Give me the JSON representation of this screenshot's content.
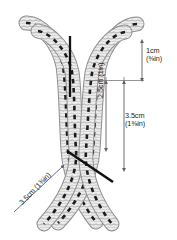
{
  "figure": {
    "type": "braided-cord-knot-diagram"
  },
  "colors": {
    "cord_fill": "#e8e8e8",
    "cord_outline": "#9a9a9a",
    "cord_dash": "#1a1a1a",
    "guide_line": "#6e6e6e",
    "pointer": "#111111",
    "text": "#231f20",
    "background": "#ffffff"
  },
  "annotations": {
    "top_gap": {
      "value_metric": "1cm",
      "value_imperial": "(⅜in)",
      "name": "1cm-dimension"
    },
    "lower_span": {
      "value_metric": "3.5cm",
      "value_imperial": "(1⅜in)",
      "name": "3.5cm-dimension"
    },
    "inner_span": {
      "value_metric": "2.5cm",
      "value_imperial": "(1in)",
      "combined": "2.5cm (1in)",
      "name": "2.5cm-dimension"
    },
    "diagonal_span": {
      "value_metric": "3.5cm",
      "value_imperial": "(1⅜in)",
      "combined": "3.5cm (1⅜in)",
      "name": "3.5cm-diagonal-dimension"
    }
  },
  "geometry": {
    "strands": 4,
    "cord_width_px": 13,
    "center_x": 70,
    "guide_line_y": 80,
    "arrow_1cm_x": 142,
    "arrow_1cm_from_y": 40,
    "arrow_1cm_to_y": 80,
    "arrow_25_x": 106,
    "arrow_25_from_y": 81,
    "arrow_25_to_y": 150,
    "arrow_35_x": 124,
    "arrow_35_from_y": 81,
    "arrow_35_to_y": 170,
    "pointer_top": {
      "x1": 70,
      "y1": 36,
      "x2": 70,
      "y2": 96
    },
    "pointer_bottom": {
      "x1": 68,
      "y1": 152,
      "x2": 113,
      "y2": 182
    }
  }
}
